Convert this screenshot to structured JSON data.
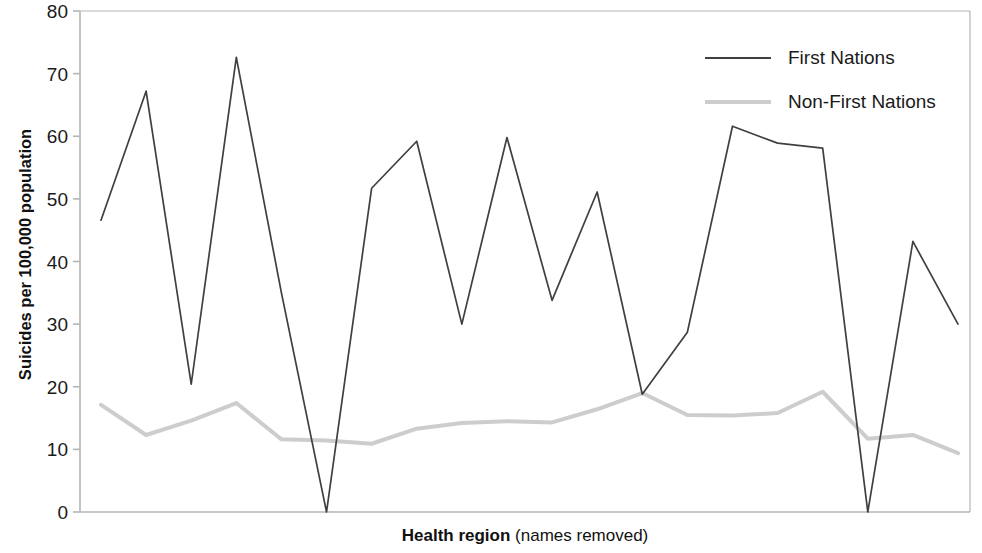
{
  "chart_data": {
    "type": "line",
    "title": "",
    "xlabel": "Health region (names removed)",
    "xlabel_bold_part": "Health region",
    "xlabel_regular_part": " (names removed)",
    "ylabel": "Suicides per 100,000 population",
    "ylim": [
      0,
      80
    ],
    "ytick_labels": [
      "0",
      "10",
      "20",
      "30",
      "40",
      "50",
      "60",
      "70",
      "80"
    ],
    "ytick_values": [
      0,
      10,
      20,
      30,
      40,
      50,
      60,
      70,
      80
    ],
    "xtick_labels": [],
    "grid": false,
    "legend_position": "top-right",
    "x": [
      1,
      2,
      3,
      4,
      5,
      6,
      7,
      8,
      9,
      10,
      11,
      12,
      13,
      14,
      15,
      16,
      17,
      18,
      19,
      20
    ],
    "series": [
      {
        "name": "First Nations",
        "color": "#3f3f44",
        "values": [
          46.6,
          67.2,
          20.4,
          72.6,
          35.0,
          0.0,
          51.7,
          59.2,
          30.0,
          59.8,
          33.8,
          51.1,
          18.8,
          28.7,
          61.6,
          58.9,
          58.1,
          0.0,
          43.2,
          30.0
        ]
      },
      {
        "name": "Non-First Nations",
        "color": "#cdcdcd",
        "values": [
          17.1,
          12.3,
          14.6,
          17.4,
          11.6,
          11.4,
          10.9,
          13.3,
          14.2,
          14.5,
          14.3,
          16.4,
          19.0,
          15.5,
          15.4,
          15.8,
          19.2,
          11.7,
          12.3,
          9.4
        ]
      }
    ],
    "legend": [
      {
        "label": "First Nations",
        "color": "#3f3f44"
      },
      {
        "label": "Non-First Nations",
        "color": "#cdcdcd"
      }
    ],
    "axis_color": "#b5b5b5",
    "plot_area": {
      "left": 80,
      "right": 970,
      "top": 11,
      "bottom": 512
    }
  }
}
